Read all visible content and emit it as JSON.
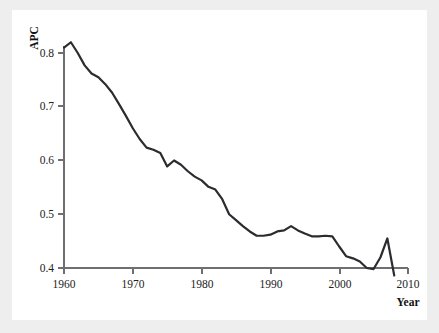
{
  "chart_data": {
    "type": "line",
    "title": "",
    "subtitle": "",
    "xlabel": "Year",
    "ylabel": "APC",
    "xlim": [
      1960,
      2010
    ],
    "ylim": [
      0.37,
      0.835
    ],
    "grid": false,
    "legend": null,
    "xticks": [
      1960,
      1970,
      1980,
      1990,
      2000,
      2010
    ],
    "xtick_labels": [
      "1960",
      "1970",
      "1980",
      "1990",
      "2000",
      "2010"
    ],
    "yticks": [
      0.4,
      0.5,
      0.6,
      0.7,
      0.8
    ],
    "ytick_labels": [
      "0.4",
      "0.5",
      "0.6",
      "0.7",
      "0.8"
    ],
    "line_color": "#2c2c30",
    "background_color": "#ffffff",
    "page_background_color": "#eeeeef",
    "axis_color": "#6f6f72",
    "series": [
      {
        "name": "APC",
        "x": [
          1960,
          1961,
          1962,
          1963,
          1964,
          1965,
          1966,
          1967,
          1968,
          1969,
          1970,
          1971,
          1972,
          1973,
          1974,
          1975,
          1976,
          1977,
          1978,
          1979,
          1980,
          1981,
          1982,
          1983,
          1984,
          1985,
          1986,
          1987,
          1988,
          1989,
          1990,
          1991,
          1992,
          1993,
          1994,
          1995,
          1996,
          1997,
          1998,
          1999,
          2000,
          2001,
          2002,
          2003,
          2004,
          2005,
          2006,
          2007,
          2008
        ],
        "values": [
          0.81,
          0.82,
          0.8,
          0.777,
          0.762,
          0.755,
          0.742,
          0.726,
          0.705,
          0.683,
          0.66,
          0.64,
          0.624,
          0.62,
          0.614,
          0.589,
          0.6,
          0.592,
          0.58,
          0.57,
          0.563,
          0.551,
          0.546,
          0.528,
          0.5,
          0.489,
          0.478,
          0.468,
          0.46,
          0.46,
          0.462,
          0.468,
          0.47,
          0.478,
          0.47,
          0.464,
          0.459,
          0.459,
          0.46,
          0.459,
          0.44,
          0.422,
          0.418,
          0.412,
          0.4,
          0.398,
          0.42,
          0.455,
          0.386
        ]
      }
    ],
    "annotations": []
  },
  "axes": {
    "y_axis_title": "APC",
    "x_axis_title": "Year"
  }
}
